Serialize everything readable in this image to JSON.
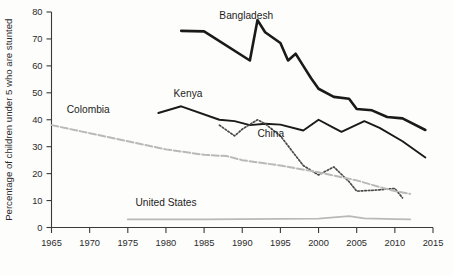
{
  "chart_data": {
    "type": "line",
    "title": "",
    "xlabel": "",
    "ylabel": "Percentage of children under 5 who are stunted",
    "xlim": [
      1965,
      2015
    ],
    "ylim": [
      0,
      80
    ],
    "grid": false,
    "legend_position": "inline-labels",
    "x_ticks": [
      "1965",
      "1970",
      "1975",
      "1980",
      "1985",
      "1990",
      "1995",
      "2000",
      "2005",
      "2010",
      "2015"
    ],
    "y_ticks": [
      "0",
      "10",
      "20",
      "30",
      "40",
      "50",
      "60",
      "70",
      "80"
    ],
    "series": [
      {
        "name": "Bangladesh",
        "color": "#1a1a1a",
        "style": "solid",
        "width": 2.6,
        "label_x": 1987,
        "label_y": 77.5,
        "points": [
          [
            1982,
            73.0
          ],
          [
            1985,
            72.8
          ],
          [
            1991,
            62.0
          ],
          [
            1992,
            77.0
          ],
          [
            1993,
            72.5
          ],
          [
            1995,
            68.5
          ],
          [
            1996,
            62.0
          ],
          [
            1997,
            64.5
          ],
          [
            1998,
            60.0
          ],
          [
            1999,
            55.5
          ],
          [
            2000,
            51.5
          ],
          [
            2002,
            48.5
          ],
          [
            2004,
            47.8
          ],
          [
            2005,
            44.0
          ],
          [
            2007,
            43.5
          ],
          [
            2009,
            41.0
          ],
          [
            2011,
            40.5
          ],
          [
            2014,
            36.2
          ]
        ]
      },
      {
        "name": "Kenya",
        "color": "#1a1a1a",
        "style": "solid",
        "width": 1.9,
        "label_x": 1981,
        "label_y": 48.5,
        "points": [
          [
            1979,
            42.5
          ],
          [
            1982,
            45.0
          ],
          [
            1987,
            40.0
          ],
          [
            1989,
            39.5
          ],
          [
            1991,
            38.0
          ],
          [
            1993,
            38.5
          ],
          [
            1995,
            38.2
          ],
          [
            1998,
            36.0
          ],
          [
            2000,
            40.0
          ],
          [
            2002,
            37.0
          ],
          [
            2003,
            35.5
          ],
          [
            2006,
            39.5
          ],
          [
            2008,
            37.0
          ],
          [
            2011,
            32.0
          ],
          [
            2014,
            26.0
          ]
        ]
      },
      {
        "name": "China",
        "color": "#4a4a4a",
        "style": "dotted",
        "width": 1.7,
        "label_x": 1992,
        "label_y": 33.5,
        "points": [
          [
            1987,
            38.0
          ],
          [
            1989,
            34.0
          ],
          [
            1990,
            36.5
          ],
          [
            1992,
            40.0
          ],
          [
            1993,
            38.5
          ],
          [
            1995,
            34.0
          ],
          [
            1998,
            23.0
          ],
          [
            2000,
            19.5
          ],
          [
            2002,
            22.5
          ],
          [
            2004,
            17.0
          ],
          [
            2005,
            13.5
          ],
          [
            2007,
            13.8
          ],
          [
            2008,
            14.0
          ],
          [
            2010,
            14.5
          ],
          [
            2011,
            11.0
          ]
        ]
      },
      {
        "name": "Colombia",
        "color": "#b9b9b9",
        "style": "dashed",
        "width": 2.0,
        "label_x": 1967,
        "label_y": 42.5,
        "points": [
          [
            1965,
            38.0
          ],
          [
            1970,
            35.0
          ],
          [
            1975,
            32.0
          ],
          [
            1980,
            29.0
          ],
          [
            1985,
            27.0
          ],
          [
            1988,
            26.5
          ],
          [
            1990,
            25.0
          ],
          [
            1995,
            23.0
          ],
          [
            2000,
            20.5
          ],
          [
            2005,
            17.5
          ],
          [
            2008,
            15.0
          ],
          [
            2010,
            13.5
          ],
          [
            2012,
            12.5
          ]
        ]
      },
      {
        "name": "United States",
        "color": "#b9b9b9",
        "style": "solid",
        "width": 1.8,
        "label_x": 1976,
        "label_y": 8.0,
        "points": [
          [
            1975,
            3.0
          ],
          [
            1985,
            3.0
          ],
          [
            1995,
            3.2
          ],
          [
            2000,
            3.3
          ],
          [
            2004,
            4.2
          ],
          [
            2006,
            3.4
          ],
          [
            2010,
            3.1
          ],
          [
            2012,
            3.0
          ]
        ]
      }
    ]
  }
}
